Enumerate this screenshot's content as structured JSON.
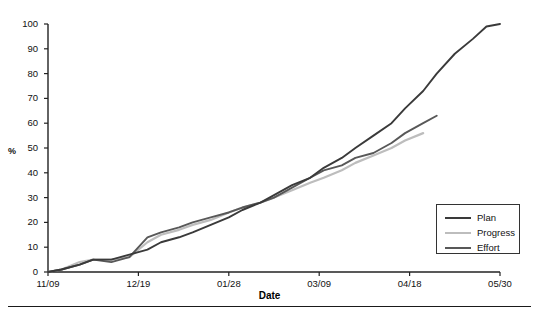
{
  "chart_data": {
    "type": "line",
    "title": "",
    "xlabel": "Date",
    "ylabel": "%",
    "ylim": [
      0,
      100
    ],
    "yticks": [
      0,
      10,
      20,
      30,
      40,
      50,
      60,
      70,
      80,
      90,
      100
    ],
    "xticks": [
      "11/09",
      "12/19",
      "01/28",
      "03/09",
      "04/18",
      "05/30"
    ],
    "grid": false,
    "legend_position": "bottom-right",
    "legend": [
      "Plan",
      "Progress",
      "Effort"
    ],
    "colors": {
      "Plan": "#3a3a3a",
      "Progress": "#bdbdbd",
      "Effort": "#585858",
      "axis": "#222222",
      "background": "#ffffff"
    },
    "x": [
      0,
      3,
      7,
      10,
      14,
      18,
      22,
      25,
      29,
      32,
      36,
      40,
      43,
      47,
      50,
      54,
      58,
      61,
      65,
      68,
      72,
      76,
      79,
      83,
      86,
      90,
      94,
      97,
      100
    ],
    "series": [
      {
        "name": "Plan",
        "values": [
          0,
          1,
          3,
          5,
          5,
          7,
          9,
          12,
          14,
          16,
          19,
          22,
          25,
          28,
          31,
          35,
          38,
          42,
          46,
          50,
          55,
          60,
          66,
          73,
          80,
          88,
          94,
          99,
          100
        ]
      },
      {
        "name": "Progress",
        "values": [
          0,
          1,
          4,
          5,
          5,
          6,
          12,
          15,
          17,
          19,
          21,
          24,
          26,
          28,
          30,
          33,
          36,
          38,
          41,
          44,
          47,
          50,
          53,
          56,
          null,
          null,
          null,
          null,
          null
        ]
      },
      {
        "name": "Effort",
        "values": [
          0,
          1,
          3,
          5,
          4,
          6,
          14,
          16,
          18,
          20,
          22,
          24,
          26,
          28,
          30,
          34,
          38,
          41,
          43,
          46,
          48,
          52,
          56,
          60,
          63,
          null,
          null,
          null,
          null
        ]
      }
    ]
  },
  "axis_labels": {
    "y_title": "%",
    "x_title": "Date"
  }
}
